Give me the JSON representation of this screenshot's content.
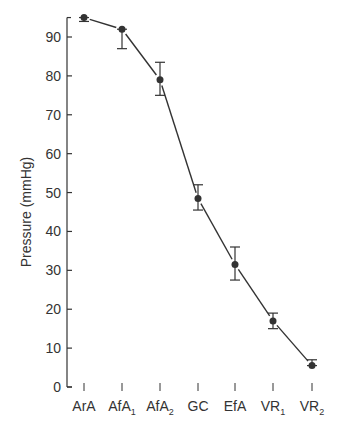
{
  "chart_data": {
    "type": "line",
    "title": "",
    "xlabel": "",
    "ylabel": "Pressure (mmHg)",
    "ylim": [
      0,
      95
    ],
    "yticks": [
      0,
      10,
      20,
      30,
      40,
      50,
      60,
      70,
      80,
      90
    ],
    "grid": false,
    "legend": null,
    "categories": [
      "ArA",
      "AfA1",
      "AfA2",
      "GC",
      "EfA",
      "VR1",
      "VR2"
    ],
    "category_labels": [
      {
        "base": "ArA",
        "sub": ""
      },
      {
        "base": "AfA",
        "sub": "1"
      },
      {
        "base": "AfA",
        "sub": "2"
      },
      {
        "base": "GC",
        "sub": ""
      },
      {
        "base": "EfA",
        "sub": ""
      },
      {
        "base": "VR",
        "sub": "1"
      },
      {
        "base": "VR",
        "sub": "2"
      }
    ],
    "series": [
      {
        "name": "Pressure",
        "values": [
          95,
          92,
          79,
          48.5,
          31.5,
          17,
          5.5
        ],
        "error_low": [
          94,
          87,
          75,
          45.5,
          27.5,
          15,
          5.5
        ],
        "error_high": [
          95,
          92,
          83.5,
          52,
          36,
          19,
          7
        ],
        "marker": "filled-circle",
        "color": "#333333"
      }
    ]
  }
}
